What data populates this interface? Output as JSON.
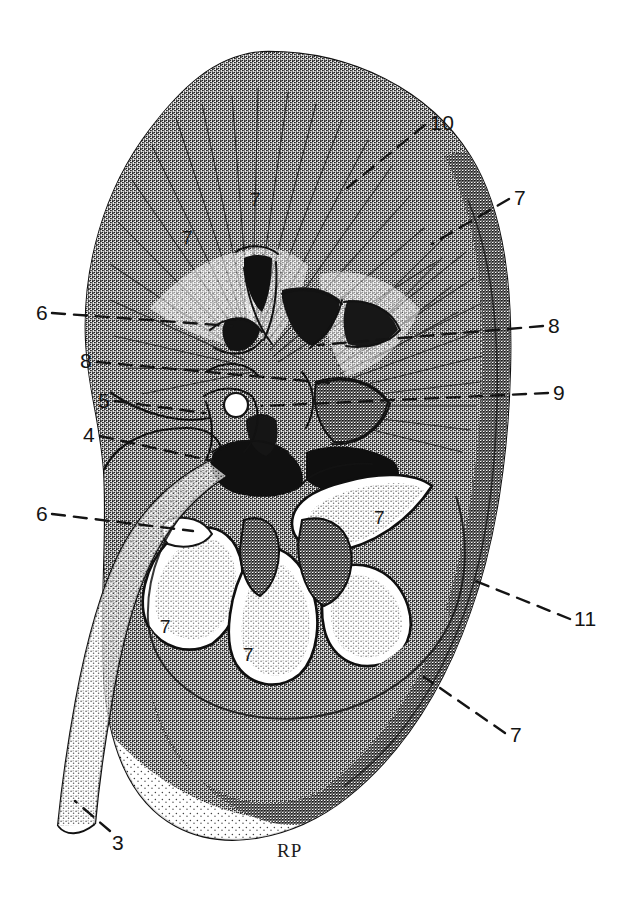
{
  "figure": {
    "artist_signature": "RP",
    "background_color": "#ffffff",
    "ink_color": "#1a1a1a",
    "style": "stipple-and-line pen drawing, black on white"
  },
  "leader_labels": [
    {
      "id": "label-10",
      "text": "10",
      "x": 430,
      "y": 112,
      "line": {
        "x1": 425,
        "y1": 125,
        "x2": 347,
        "y2": 188
      }
    },
    {
      "id": "label-7-upper-right",
      "text": "7",
      "x": 514,
      "y": 187,
      "line": {
        "x1": 509,
        "y1": 199,
        "x2": 432,
        "y2": 244
      }
    },
    {
      "id": "label-6-upper-left",
      "text": "6",
      "x": 36,
      "y": 302,
      "line": {
        "x1": 52,
        "y1": 313,
        "x2": 232,
        "y2": 326
      }
    },
    {
      "id": "label-8-right",
      "text": "8",
      "x": 548,
      "y": 315,
      "line": {
        "x1": 543,
        "y1": 326,
        "x2": 318,
        "y2": 345
      }
    },
    {
      "id": "label-8-left",
      "text": "8",
      "x": 80,
      "y": 350,
      "line": {
        "x1": 97,
        "y1": 362,
        "x2": 330,
        "y2": 383
      }
    },
    {
      "id": "label-9-right",
      "text": "9",
      "x": 553,
      "y": 382,
      "line": {
        "x1": 548,
        "y1": 393,
        "x2": 262,
        "y2": 406
      }
    },
    {
      "id": "label-5-left",
      "text": "5",
      "x": 98,
      "y": 390,
      "line": {
        "x1": 115,
        "y1": 401,
        "x2": 205,
        "y2": 413
      }
    },
    {
      "id": "label-4-left",
      "text": "4",
      "x": 83,
      "y": 424,
      "line": {
        "x1": 100,
        "y1": 436,
        "x2": 213,
        "y2": 461
      }
    },
    {
      "id": "label-6-lower-left",
      "text": "6",
      "x": 36,
      "y": 503,
      "line": {
        "x1": 52,
        "y1": 514,
        "x2": 193,
        "y2": 531
      }
    },
    {
      "id": "label-11-right",
      "text": "11",
      "x": 574,
      "y": 608,
      "line": {
        "x1": 570,
        "y1": 619,
        "x2": 468,
        "y2": 578
      }
    },
    {
      "id": "label-7-lower-right",
      "text": "7",
      "x": 510,
      "y": 724,
      "line": {
        "x1": 505,
        "y1": 733,
        "x2": 424,
        "y2": 677
      }
    },
    {
      "id": "label-3-ureter",
      "text": "3",
      "x": 112,
      "y": 832,
      "line": {
        "x1": 110,
        "y1": 831,
        "x2": 75,
        "y2": 801
      }
    }
  ],
  "inner_labels": [
    {
      "id": "inner-7-upper-mid",
      "text": "7",
      "x": 250,
      "y": 190
    },
    {
      "id": "inner-7-upper-left",
      "text": "7",
      "x": 182,
      "y": 228
    },
    {
      "id": "inner-7-pyramid-right",
      "text": "7",
      "x": 374,
      "y": 508
    },
    {
      "id": "inner-7-pyramid-left",
      "text": "7",
      "x": 160,
      "y": 617
    },
    {
      "id": "inner-7-pyramid-mid",
      "text": "7",
      "x": 243,
      "y": 645
    }
  ],
  "signature": {
    "text": "RP",
    "x": 277,
    "y": 841
  },
  "legend_keys": {
    "3": "ureter",
    "4": "renal pelvis",
    "5": "renal vessels at hilum",
    "6": "minor calyx",
    "7": "renal pyramid (medulla)",
    "8": "major calyx",
    "9": "renal column",
    "10": "renal cortex",
    "11": "fibrous capsule"
  }
}
